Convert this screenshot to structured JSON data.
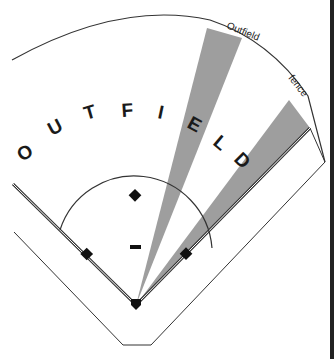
{
  "diagram": {
    "title_letters": [
      "O",
      "U",
      "T",
      "F",
      "I",
      "E",
      "L",
      "D"
    ],
    "title_word": "OUTFIELD",
    "labels": {
      "outfield": "Outfield",
      "fence": "fence"
    },
    "colors": {
      "line": "#333333",
      "wedge_fill": "#9a9a9a",
      "base_fill": "#111111",
      "border": "#222222",
      "background": "#ffffff"
    },
    "elements": {
      "home_plate": "home-plate",
      "first_base": "first-base",
      "second_base": "second-base",
      "third_base": "third-base",
      "pitchers_rubber": "pitchers-rubber",
      "infield_arc": "infield-arc",
      "outfield_fence_arc": "outfield-fence-arc",
      "shaded_wedges": 2
    }
  }
}
